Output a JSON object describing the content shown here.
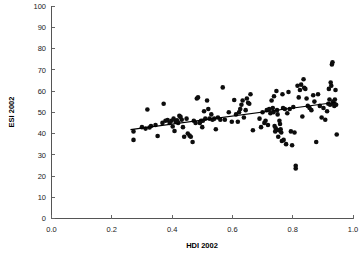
{
  "chart_data": {
    "type": "scatter",
    "title": "",
    "xlabel": "HDI 2002",
    "ylabel": "ESI 2002",
    "xlim": [
      0.0,
      1.0
    ],
    "ylim": [
      0,
      100
    ],
    "xticks": [
      "0.0",
      "0.2",
      "0.4",
      "0.6",
      "0.8",
      "1.0"
    ],
    "xtick_values": [
      0.0,
      0.2,
      0.4,
      0.6,
      0.8,
      1.0
    ],
    "yticks": [
      "0",
      "10",
      "20",
      "30",
      "40",
      "50",
      "60",
      "70",
      "80",
      "90",
      "100"
    ],
    "ytick_values": [
      0,
      10,
      20,
      30,
      40,
      50,
      60,
      70,
      80,
      90,
      100
    ],
    "grid": false,
    "legend": false,
    "legend_position": "none",
    "marker_color": "#0d0d0d",
    "marker_size": 2.3,
    "trendline": {
      "type": "linear",
      "color": "#000000",
      "x_start": 0.262,
      "y_start": 41.8,
      "x_end": 0.945,
      "y_end": 54.7
    },
    "points": [
      [
        0.272,
        41.0
      ],
      [
        0.272,
        37.0
      ],
      [
        0.3,
        43.0
      ],
      [
        0.312,
        42.3
      ],
      [
        0.318,
        51.3
      ],
      [
        0.325,
        42.8
      ],
      [
        0.33,
        43.5
      ],
      [
        0.345,
        44.0
      ],
      [
        0.352,
        38.8
      ],
      [
        0.368,
        45.0
      ],
      [
        0.372,
        54.0
      ],
      [
        0.378,
        46.0
      ],
      [
        0.385,
        46.3
      ],
      [
        0.392,
        45.0
      ],
      [
        0.398,
        46.0
      ],
      [
        0.402,
        43.3
      ],
      [
        0.405,
        47.0
      ],
      [
        0.408,
        41.2
      ],
      [
        0.412,
        45.5
      ],
      [
        0.416,
        46.2
      ],
      [
        0.42,
        45.0
      ],
      [
        0.424,
        48.3
      ],
      [
        0.428,
        47.8
      ],
      [
        0.432,
        46.5
      ],
      [
        0.436,
        43.0
      ],
      [
        0.44,
        38.5
      ],
      [
        0.448,
        47.0
      ],
      [
        0.452,
        40.0
      ],
      [
        0.458,
        39.0
      ],
      [
        0.462,
        38.5
      ],
      [
        0.468,
        36.0
      ],
      [
        0.472,
        46.0
      ],
      [
        0.478,
        45.0
      ],
      [
        0.482,
        56.5
      ],
      [
        0.486,
        57.0
      ],
      [
        0.492,
        45.0
      ],
      [
        0.496,
        46.0
      ],
      [
        0.5,
        43.0
      ],
      [
        0.502,
        46.0
      ],
      [
        0.506,
        50.5
      ],
      [
        0.51,
        47.0
      ],
      [
        0.516,
        55.5
      ],
      [
        0.52,
        51.5
      ],
      [
        0.524,
        47.0
      ],
      [
        0.53,
        49.0
      ],
      [
        0.534,
        46.5
      ],
      [
        0.54,
        47.0
      ],
      [
        0.545,
        42.0
      ],
      [
        0.552,
        47.5
      ],
      [
        0.56,
        46.5
      ],
      [
        0.568,
        61.7
      ],
      [
        0.575,
        46.5
      ],
      [
        0.588,
        50.0
      ],
      [
        0.598,
        45.5
      ],
      [
        0.606,
        55.8
      ],
      [
        0.612,
        49.0
      ],
      [
        0.618,
        45.5
      ],
      [
        0.622,
        50.0
      ],
      [
        0.626,
        51.5
      ],
      [
        0.63,
        53.5
      ],
      [
        0.634,
        55.5
      ],
      [
        0.638,
        47.5
      ],
      [
        0.644,
        51.0
      ],
      [
        0.648,
        56.5
      ],
      [
        0.652,
        54.5
      ],
      [
        0.656,
        54.0
      ],
      [
        0.66,
        58.5
      ],
      [
        0.668,
        41.5
      ],
      [
        0.69,
        47.0
      ],
      [
        0.695,
        43.0
      ],
      [
        0.7,
        50.0
      ],
      [
        0.706,
        45.0
      ],
      [
        0.71,
        46.0
      ],
      [
        0.714,
        51.0
      ],
      [
        0.718,
        44.0
      ],
      [
        0.722,
        51.5
      ],
      [
        0.726,
        49.5
      ],
      [
        0.73,
        55.5
      ],
      [
        0.734,
        52.0
      ],
      [
        0.736,
        50.0
      ],
      [
        0.738,
        57.5
      ],
      [
        0.74,
        43.5
      ],
      [
        0.742,
        41.0
      ],
      [
        0.744,
        42.5
      ],
      [
        0.746,
        60.0
      ],
      [
        0.748,
        51.0
      ],
      [
        0.75,
        49.0
      ],
      [
        0.752,
        38.5
      ],
      [
        0.754,
        41.5
      ],
      [
        0.756,
        46.0
      ],
      [
        0.758,
        44.5
      ],
      [
        0.76,
        42.0
      ],
      [
        0.762,
        40.5
      ],
      [
        0.764,
        36.5
      ],
      [
        0.766,
        58.5
      ],
      [
        0.768,
        52.0
      ],
      [
        0.77,
        37.0
      ],
      [
        0.774,
        51.5
      ],
      [
        0.778,
        35.0
      ],
      [
        0.782,
        49.5
      ],
      [
        0.786,
        59.5
      ],
      [
        0.79,
        51.5
      ],
      [
        0.794,
        41.0
      ],
      [
        0.798,
        34.5
      ],
      [
        0.802,
        52.5
      ],
      [
        0.806,
        40.5
      ],
      [
        0.81,
        24.8
      ],
      [
        0.81,
        23.5
      ],
      [
        0.816,
        62.5
      ],
      [
        0.82,
        57.0
      ],
      [
        0.824,
        60.5
      ],
      [
        0.828,
        63.0
      ],
      [
        0.832,
        48.0
      ],
      [
        0.836,
        65.5
      ],
      [
        0.838,
        61.5
      ],
      [
        0.842,
        61.0
      ],
      [
        0.846,
        56.5
      ],
      [
        0.85,
        53.0
      ],
      [
        0.856,
        52.0
      ],
      [
        0.862,
        51.0
      ],
      [
        0.868,
        58.0
      ],
      [
        0.872,
        55.0
      ],
      [
        0.878,
        36.0
      ],
      [
        0.884,
        58.5
      ],
      [
        0.89,
        53.0
      ],
      [
        0.896,
        47.5
      ],
      [
        0.902,
        52.0
      ],
      [
        0.908,
        46.5
      ],
      [
        0.914,
        50.5
      ],
      [
        0.918,
        54.0
      ],
      [
        0.92,
        61.0
      ],
      [
        0.922,
        56.0
      ],
      [
        0.924,
        53.5
      ],
      [
        0.926,
        64.0
      ],
      [
        0.928,
        62.5
      ],
      [
        0.93,
        72.5
      ],
      [
        0.932,
        73.5
      ],
      [
        0.934,
        55.0
      ],
      [
        0.936,
        54.0
      ],
      [
        0.938,
        53.0
      ],
      [
        0.94,
        56.0
      ],
      [
        0.942,
        60.5
      ],
      [
        0.944,
        53.5
      ],
      [
        0.946,
        39.5
      ]
    ]
  }
}
